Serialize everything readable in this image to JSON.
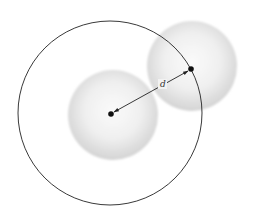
{
  "diagram": {
    "type": "sphere-interaction-radius",
    "distance_label": "d",
    "colors": {
      "background": "#ffffff",
      "circle_stroke": "#222222",
      "sphere_highlight": "#fafafa",
      "sphere_shade": "#d6d6d6",
      "center_dot": "#111111",
      "arrow": "#222222"
    },
    "geometry": {
      "big_circle": {
        "cx": 110,
        "cy": 113,
        "r": 92
      },
      "sphere_1": {
        "cx": 113,
        "cy": 115,
        "r": 45
      },
      "sphere_2": {
        "cx": 192,
        "cy": 66,
        "r": 45
      },
      "center_1": {
        "x": 111,
        "y": 114
      },
      "center_2": {
        "x": 191,
        "y": 69
      },
      "label_position": {
        "x": 163,
        "y": 87
      }
    }
  }
}
